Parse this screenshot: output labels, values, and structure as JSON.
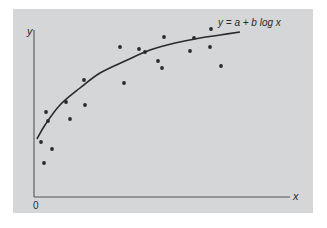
{
  "chart_data": {
    "type": "scatter",
    "title": "",
    "xlabel": "x",
    "ylabel": "y",
    "origin_label": "0",
    "grid": false,
    "legend": null,
    "fit_curve": {
      "label": "y = a + b log x",
      "model": "logarithmic",
      "pixel_path": [
        [
          37,
          139
        ],
        [
          45,
          125
        ],
        [
          60,
          105
        ],
        [
          80,
          88
        ],
        [
          100,
          73
        ],
        [
          125,
          61
        ],
        [
          150,
          50
        ],
        [
          175,
          43
        ],
        [
          200,
          38
        ],
        [
          220,
          35
        ],
        [
          240,
          32
        ]
      ]
    },
    "points_pixel": [
      [
        41,
        142
      ],
      [
        44,
        163
      ],
      [
        52,
        149
      ],
      [
        46,
        112
      ],
      [
        48,
        121
      ],
      [
        66,
        102
      ],
      [
        70,
        119
      ],
      [
        84,
        80
      ],
      [
        85,
        105
      ],
      [
        120,
        47
      ],
      [
        124,
        83
      ],
      [
        139,
        49
      ],
      [
        145,
        52
      ],
      [
        158,
        61
      ],
      [
        162,
        68
      ],
      [
        164,
        37
      ],
      [
        190,
        51
      ],
      [
        194,
        38
      ],
      [
        210,
        47
      ],
      [
        211,
        29
      ],
      [
        221,
        66
      ]
    ],
    "axes": {
      "origin_px": [
        34,
        197
      ],
      "x_end_px": 290,
      "y_top_px": 30
    }
  },
  "colors": {
    "panel": "#d4d6d7",
    "ink": "#2a2a2a",
    "axis": "#555555"
  }
}
